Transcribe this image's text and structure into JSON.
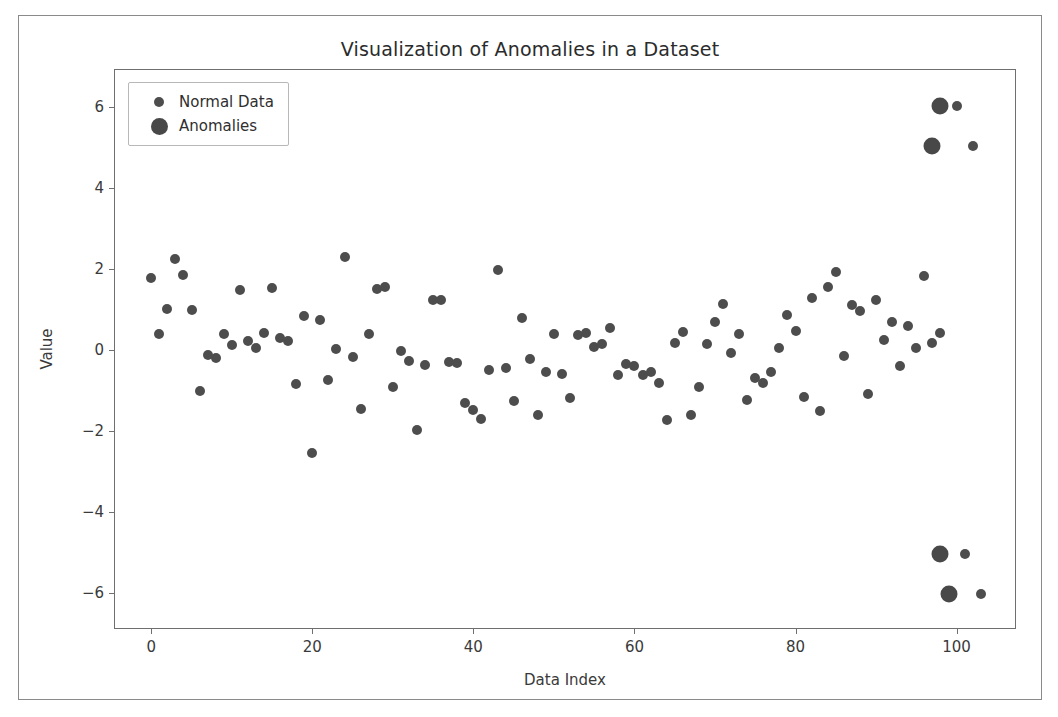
{
  "figure": {
    "title": "Visualization of Anomalies in a Dataset",
    "background": "#ffffff",
    "border_color": "#8a8a8a"
  },
  "axes": {
    "x_title": "Data Index",
    "y_title": "Value",
    "x_ticks": [
      "0",
      "20",
      "40",
      "60",
      "80",
      "100"
    ],
    "y_ticks": [
      "6",
      "4",
      "2",
      "0",
      "−2",
      "−4",
      "−6"
    ]
  },
  "legend": {
    "items": [
      {
        "label": "Normal Data",
        "marker": "small-circle-marker",
        "color": "#4d4d4d"
      },
      {
        "label": "Anomalies",
        "marker": "large-circle-marker",
        "color": "#484848"
      }
    ]
  },
  "chart_data": {
    "type": "scatter",
    "title": "Visualization of Anomalies in a Dataset",
    "xlabel": "Data Index",
    "ylabel": "Value",
    "xlim": [
      -4.5,
      107.5
    ],
    "ylim": [
      -6.9,
      6.9
    ],
    "grid": false,
    "legend_position": "upper left",
    "marker_colors": {
      "normal": "#4d4d4d",
      "anomaly": "#484848"
    },
    "marker_sizes": {
      "normal": 10,
      "anomaly": 17
    },
    "series": [
      {
        "name": "Normal Data",
        "marker_size": 10,
        "color": "#4d4d4d",
        "points": [
          [
            0,
            1.78
          ],
          [
            1,
            0.4
          ],
          [
            2,
            1.0
          ],
          [
            3,
            2.25
          ],
          [
            4,
            1.86
          ],
          [
            5,
            0.98
          ],
          [
            6,
            -1.0
          ],
          [
            7,
            -0.12
          ],
          [
            8,
            -0.2
          ],
          [
            9,
            0.4
          ],
          [
            10,
            0.13
          ],
          [
            11,
            1.47
          ],
          [
            12,
            0.22
          ],
          [
            13,
            0.05
          ],
          [
            14,
            0.42
          ],
          [
            15,
            1.52
          ],
          [
            16,
            0.3
          ],
          [
            17,
            0.22
          ],
          [
            18,
            -0.85
          ],
          [
            19,
            0.83
          ],
          [
            20,
            -2.55
          ],
          [
            21,
            0.75
          ],
          [
            22,
            -0.75
          ],
          [
            23,
            0.02
          ],
          [
            24,
            2.28
          ],
          [
            25,
            -0.18
          ],
          [
            26,
            -1.45
          ],
          [
            27,
            0.4
          ],
          [
            28,
            1.5
          ],
          [
            29,
            1.55
          ],
          [
            30,
            -0.9
          ],
          [
            31,
            -0.02
          ],
          [
            32,
            -0.28
          ],
          [
            33,
            -1.98
          ],
          [
            34,
            -0.37
          ],
          [
            35,
            1.22
          ],
          [
            36,
            1.22
          ],
          [
            37,
            -0.3
          ],
          [
            38,
            -0.32
          ],
          [
            39,
            -1.3
          ],
          [
            40,
            -1.48
          ],
          [
            41,
            -1.7
          ],
          [
            42,
            -0.5
          ],
          [
            43,
            1.97
          ],
          [
            44,
            -0.45
          ],
          [
            45,
            -1.25
          ],
          [
            46,
            0.78
          ],
          [
            47,
            -0.22
          ],
          [
            48,
            -1.6
          ],
          [
            49,
            -0.55
          ],
          [
            50,
            0.4
          ],
          [
            51,
            -0.58
          ],
          [
            52,
            -1.18
          ],
          [
            53,
            0.37
          ],
          [
            54,
            0.42
          ],
          [
            55,
            0.08
          ],
          [
            56,
            0.15
          ],
          [
            57,
            0.55
          ],
          [
            58,
            -0.62
          ],
          [
            59,
            -0.35
          ],
          [
            60,
            -0.4
          ],
          [
            61,
            -0.62
          ],
          [
            62,
            -0.55
          ],
          [
            63,
            -0.82
          ],
          [
            64,
            -1.72
          ],
          [
            65,
            0.18
          ],
          [
            66,
            0.45
          ],
          [
            67,
            -1.6
          ],
          [
            68,
            -0.9
          ],
          [
            69,
            0.15
          ],
          [
            70,
            0.7
          ],
          [
            71,
            1.13
          ],
          [
            72,
            -0.08
          ],
          [
            73,
            0.4
          ],
          [
            74,
            -1.22
          ],
          [
            75,
            -0.7
          ],
          [
            76,
            -0.82
          ],
          [
            77,
            -0.55
          ],
          [
            78,
            0.05
          ],
          [
            79,
            0.87
          ],
          [
            80,
            0.48
          ],
          [
            81,
            -1.15
          ],
          [
            82,
            1.28
          ],
          [
            83,
            -1.5
          ],
          [
            84,
            1.55
          ],
          [
            85,
            1.93
          ],
          [
            86,
            -0.15
          ],
          [
            87,
            1.1
          ],
          [
            88,
            0.95
          ],
          [
            89,
            -1.08
          ],
          [
            90,
            1.22
          ],
          [
            91,
            0.25
          ],
          [
            92,
            0.7
          ],
          [
            93,
            -0.4
          ],
          [
            94,
            0.6
          ],
          [
            95,
            0.05
          ],
          [
            96,
            1.82
          ],
          [
            97,
            0.18
          ],
          [
            98,
            0.42
          ],
          [
            100,
            6.02
          ],
          [
            102,
            5.02
          ],
          [
            101,
            -5.02
          ],
          [
            103,
            -6.02
          ]
        ]
      },
      {
        "name": "Anomalies",
        "marker_size": 17,
        "color": "#484848",
        "points": [
          [
            98,
            6.02
          ],
          [
            97,
            5.02
          ],
          [
            98,
            -5.02
          ],
          [
            99,
            -6.02
          ]
        ]
      }
    ]
  }
}
